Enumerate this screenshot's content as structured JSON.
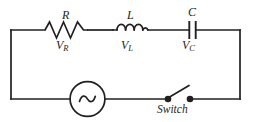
{
  "diagram": {
    "background_color": "#ffffff",
    "line_color": "#231f20"
  },
  "components": {
    "resistor": {
      "symbol_name": "resistor-zigzag-icon",
      "label": "R",
      "voltage_label_base": "V",
      "voltage_label_sub": "R"
    },
    "inductor": {
      "symbol_name": "inductor-coil-icon",
      "label": "L",
      "voltage_label_base": "V",
      "voltage_label_sub": "L"
    },
    "capacitor": {
      "symbol_name": "capacitor-plates-icon",
      "label": "C",
      "voltage_label_base": "V",
      "voltage_label_sub": "C"
    },
    "source": {
      "symbol_name": "ac-source-icon",
      "label": "~"
    },
    "switch": {
      "symbol_name": "open-switch-icon",
      "label": "Switch",
      "state": "open"
    }
  }
}
